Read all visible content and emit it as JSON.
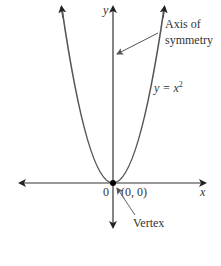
{
  "diagram": {
    "axes": {
      "x_label": "x",
      "y_label": "y",
      "origin_label": "0"
    },
    "curve": {
      "equation_prefix": "y = x",
      "equation_exponent": "2",
      "type": "parabola",
      "color": "#555555"
    },
    "annotations": {
      "axis_of_symmetry_line1": "Axis of",
      "axis_of_symmetry_line2": "symmetry",
      "vertex_label": "Vertex",
      "vertex_coords": "(0, 0)"
    },
    "colors": {
      "axis": "#333333",
      "curve": "#555555",
      "text": "#333333",
      "pointer": "#666666",
      "vertex_dot": "#000000"
    }
  }
}
